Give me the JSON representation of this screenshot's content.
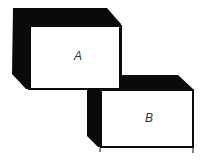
{
  "diagram": {
    "boxes": [
      {
        "id": "A",
        "label": "A"
      },
      {
        "id": "B",
        "label": "B"
      }
    ],
    "colors": {
      "ink": "#0a0a0a",
      "face": "#ffffff",
      "label": "#333333"
    }
  }
}
